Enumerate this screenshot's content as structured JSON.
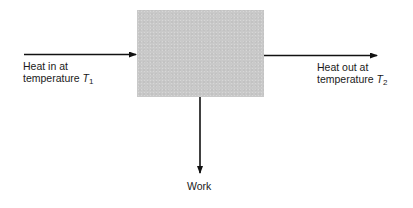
{
  "diagram": {
    "type": "heat-engine-block-diagram",
    "engine_box": {
      "fill": "#c9c9c9"
    },
    "input": {
      "line1": "Heat in at",
      "line2_prefix": "temperature",
      "symbol": "T",
      "subscript": "1"
    },
    "output": {
      "line1": "Heat out at",
      "line2_prefix": "temperature",
      "symbol": "T",
      "subscript": "2"
    },
    "work": {
      "label": "Work"
    },
    "arrow_color": "#111111"
  }
}
